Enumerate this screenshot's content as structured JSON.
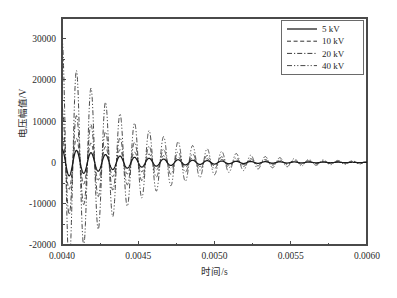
{
  "chart_data": {
    "type": "line",
    "title": "",
    "xlabel": "时间/s",
    "ylabel": "电压幅值/V",
    "xlim": [
      0.004,
      0.006
    ],
    "ylim": [
      -20000,
      35000
    ],
    "xticks": [
      0.004,
      0.0045,
      0.005,
      0.0055,
      0.006
    ],
    "xtick_labels": [
      "0.0040",
      "0.0045",
      "0.0050",
      "0.0055",
      "0.0060"
    ],
    "yticks": [
      30000,
      20000,
      10000,
      0,
      -10000,
      -20000
    ],
    "ytick_labels": [
      "30000",
      "20000",
      "10000",
      "0",
      "-10000",
      "-20000"
    ],
    "grid": false,
    "legend_position": "top-right",
    "frequency_hz": 10500,
    "decay_time_constant_s": 0.00045,
    "series": [
      {
        "name": "5 kV",
        "label": "5 kV",
        "dash": "solid",
        "color": "#1a1a1a",
        "width": 1.25,
        "initial_amplitude": 3600,
        "start_value": 3200
      },
      {
        "name": "10 kV",
        "label": "10 kV",
        "dash": "dashed",
        "color": "#303030",
        "width": 1.0,
        "initial_amplitude": 7200,
        "start_value": 6400
      },
      {
        "name": "20 kV",
        "label": "20 kV",
        "dash": "dashdot",
        "color": "#3a3a3a",
        "width": 1.0,
        "initial_amplitude": 14000,
        "start_value": 13500
      },
      {
        "name": "40 kV",
        "label": "40 kV",
        "dash": "dashdotdot",
        "color": "#464646",
        "width": 1.0,
        "initial_amplitude": 27500,
        "start_value": 30500
      }
    ],
    "legend_entries": [
      "5 kV",
      "10 kV",
      "20 kV",
      "40 kV"
    ]
  },
  "axes": {
    "y_title": "电压幅值/V",
    "x_title": "时间/s"
  },
  "legend": {
    "items": [
      {
        "label": "5 kV"
      },
      {
        "label": "10 kV"
      },
      {
        "label": "20 kV"
      },
      {
        "label": "40 kV"
      }
    ]
  }
}
